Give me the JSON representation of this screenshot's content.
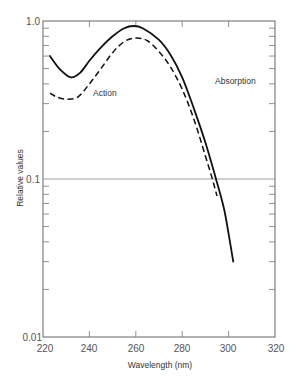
{
  "chart_data": {
    "type": "line",
    "title": "",
    "xlabel": "Wavelength  (nm)",
    "ylabel": "Relative values",
    "xlim": [
      220,
      320
    ],
    "ylim": [
      0.01,
      1.0
    ],
    "yscale": "log",
    "grid": false,
    "reference_line": {
      "y": 0.1
    },
    "x_ticks": [
      220,
      240,
      260,
      280,
      300,
      320
    ],
    "x_tick_labels": [
      "220",
      "240",
      "260",
      "280",
      "300",
      "320"
    ],
    "y_tick_labels": [
      {
        "value": 1.0,
        "label": "1.0"
      },
      {
        "value": 0.1,
        "label": "0.1"
      },
      {
        "value": 0.01,
        "label": "0.01"
      }
    ],
    "legend": null,
    "series": [
      {
        "name": "Absorption",
        "style": "solid",
        "x": [
          223,
          227,
          232,
          236,
          240,
          245,
          250,
          255,
          259,
          263,
          270,
          275,
          280,
          285,
          290,
          295,
          298,
          300,
          302
        ],
        "values": [
          0.6,
          0.5,
          0.44,
          0.47,
          0.56,
          0.68,
          0.8,
          0.9,
          0.93,
          0.9,
          0.76,
          0.61,
          0.44,
          0.28,
          0.17,
          0.095,
          0.065,
          0.045,
          0.03
        ]
      },
      {
        "name": "Action",
        "style": "dashed",
        "x": [
          223,
          226,
          230,
          235,
          240,
          245,
          250,
          255,
          260,
          265,
          270,
          275,
          280,
          285,
          290,
          293,
          295
        ],
        "values": [
          0.35,
          0.33,
          0.32,
          0.33,
          0.4,
          0.5,
          0.63,
          0.74,
          0.78,
          0.75,
          0.64,
          0.51,
          0.37,
          0.24,
          0.14,
          0.1,
          0.078
        ]
      }
    ],
    "annotations": [
      {
        "text": "Absorption",
        "x": 273,
        "y": 0.55
      },
      {
        "text": "Action",
        "x": 237,
        "y": 0.42
      }
    ]
  },
  "labels": {
    "xlabel": "Wavelength  (nm)",
    "ylabel": "Relative values",
    "absorption": "Absorption",
    "action": "Action",
    "x_ticks": [
      "220",
      "240",
      "260",
      "280",
      "300",
      "320"
    ],
    "y_ticks": [
      "1.0",
      "0.1",
      "0.01"
    ]
  }
}
